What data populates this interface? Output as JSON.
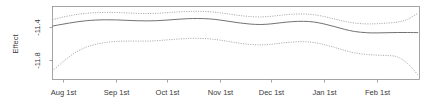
{
  "chart_data": {
    "type": "line",
    "title": "",
    "subtitle": "",
    "xlabel": "",
    "ylabel": "Effect",
    "grid": false,
    "legend_position": "none",
    "xlim": [
      0,
      215
    ],
    "ylim": [
      -11.95,
      -11.22
    ],
    "yticks": [
      -11.4,
      -11.8
    ],
    "ytick_labels": [
      "-11.4",
      "-11.8"
    ],
    "xtick_labels": [
      "Aug 1st",
      "Sep 1st",
      "Oct 1st",
      "Nov 1st",
      "Dec 1st",
      "Jan 1st",
      "Feb 1st"
    ],
    "xticks": [
      0,
      31,
      61,
      92,
      122,
      153,
      184
    ],
    "x": [
      0,
      5,
      10,
      15,
      20,
      25,
      31,
      37,
      43,
      49,
      55,
      61,
      67,
      73,
      79,
      85,
      92,
      98,
      104,
      110,
      116,
      122,
      128,
      134,
      140,
      147,
      153,
      159,
      165,
      171,
      177,
      184,
      190,
      196,
      202,
      208,
      214
    ],
    "series": [
      {
        "name": "fitted effect",
        "style": "solid",
        "color": "#6a6a6a",
        "values": [
          -11.415,
          -11.4,
          -11.385,
          -11.372,
          -11.362,
          -11.356,
          -11.353,
          -11.354,
          -11.358,
          -11.362,
          -11.364,
          -11.362,
          -11.356,
          -11.348,
          -11.342,
          -11.34,
          -11.344,
          -11.355,
          -11.37,
          -11.385,
          -11.396,
          -11.4,
          -11.394,
          -11.382,
          -11.372,
          -11.368,
          -11.375,
          -11.394,
          -11.42,
          -11.448,
          -11.47,
          -11.482,
          -11.484,
          -11.482,
          -11.48,
          -11.48,
          -11.481
        ]
      },
      {
        "name": "upper confidence bound",
        "style": "dotted",
        "color": "#9a9a9a",
        "values": [
          -11.352,
          -11.33,
          -11.312,
          -11.298,
          -11.288,
          -11.282,
          -11.279,
          -11.28,
          -11.284,
          -11.288,
          -11.29,
          -11.288,
          -11.282,
          -11.275,
          -11.27,
          -11.268,
          -11.272,
          -11.283,
          -11.297,
          -11.311,
          -11.321,
          -11.324,
          -11.318,
          -11.307,
          -11.298,
          -11.295,
          -11.302,
          -11.32,
          -11.344,
          -11.368,
          -11.386,
          -11.394,
          -11.392,
          -11.386,
          -11.376,
          -11.348,
          -11.288
        ]
      },
      {
        "name": "lower confidence bound",
        "style": "dotted",
        "color": "#9a9a9a",
        "values": [
          -11.862,
          -11.79,
          -11.72,
          -11.665,
          -11.625,
          -11.6,
          -11.58,
          -11.57,
          -11.566,
          -11.566,
          -11.566,
          -11.562,
          -11.554,
          -11.546,
          -11.54,
          -11.538,
          -11.544,
          -11.556,
          -11.572,
          -11.588,
          -11.6,
          -11.604,
          -11.598,
          -11.586,
          -11.576,
          -11.572,
          -11.58,
          -11.6,
          -11.628,
          -11.658,
          -11.684,
          -11.7,
          -11.706,
          -11.71,
          -11.724,
          -11.79,
          -11.902
        ]
      }
    ]
  },
  "axis": {
    "y_title": "Effect",
    "y_tick_1": "-11.4",
    "y_tick_2": "-11.8",
    "x_tick_1": "Aug 1st",
    "x_tick_2": "Sep 1st",
    "x_tick_3": "Oct 1st",
    "x_tick_4": "Nov 1st",
    "x_tick_5": "Dec 1st",
    "x_tick_6": "Jan 1st",
    "x_tick_7": "Feb 1st"
  },
  "colors": {
    "fit": "#6a6a6a",
    "ci": "#9a9a9a",
    "frame": "#8e8e8e",
    "text": "#3a3a3a",
    "background": "#ffffff"
  }
}
